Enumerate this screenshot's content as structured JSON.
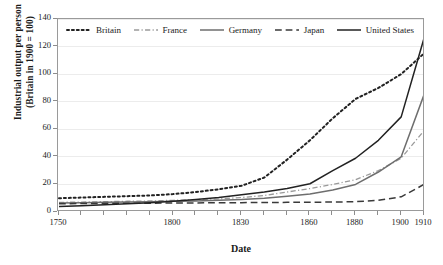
{
  "chart_data": {
    "type": "line",
    "title": "",
    "xlabel": "Date",
    "ylabel": "Industrial output per person (Britain in 1900 = 100)",
    "ylabel_line1": "Industrial output per person",
    "ylabel_line2": "(Britain in 1900 = 100)",
    "ylim": [
      0,
      140
    ],
    "yticks": [
      0,
      20,
      40,
      60,
      80,
      100,
      120,
      140
    ],
    "grid": true,
    "legend_position": "top-inside",
    "x": [
      1750,
      1760,
      1770,
      1780,
      1790,
      1800,
      1810,
      1820,
      1830,
      1840,
      1850,
      1860,
      1870,
      1880,
      1890,
      1900,
      1910
    ],
    "xticks_labeled": [
      1750,
      1800,
      1830,
      1860,
      1880,
      1900,
      1910
    ],
    "xtick_labels": [
      "1750",
      "1800",
      "1830",
      "1860",
      "1880",
      "1900",
      "1910"
    ],
    "series": [
      {
        "name": "Britain",
        "style": "dotted",
        "color": "#222222",
        "values": [
          10,
          10.5,
          11,
          11.5,
          12,
          13,
          14.5,
          16.5,
          19,
          25,
          38,
          52,
          68,
          82,
          90,
          100,
          115
        ]
      },
      {
        "name": "France",
        "style": "dash-dot",
        "color": "#9a9a9a",
        "values": [
          7,
          7.2,
          7.5,
          7.8,
          8,
          8.5,
          9,
          9.5,
          10.5,
          12,
          14.5,
          17,
          20,
          23.5,
          30,
          39,
          59
        ]
      },
      {
        "name": "Germany",
        "style": "solid",
        "color": "#6e6e6e",
        "values": [
          6.5,
          6.7,
          7,
          7.2,
          7.5,
          7.8,
          8,
          8.5,
          9,
          10,
          11.5,
          13,
          16,
          20,
          29,
          40,
          85
        ]
      },
      {
        "name": "Japan",
        "style": "dashed",
        "color": "#3a3a3a",
        "values": [
          6,
          6.1,
          6.2,
          6.3,
          6.4,
          6.5,
          6.6,
          6.7,
          6.8,
          6.9,
          7,
          7.1,
          7.2,
          7.5,
          8.5,
          11,
          20
        ]
      },
      {
        "name": "United States",
        "style": "solid",
        "color": "#222222",
        "values": [
          4,
          4.6,
          5.2,
          6,
          6.8,
          7.8,
          9,
          10.5,
          12.5,
          14.5,
          17,
          20.5,
          30,
          39,
          52,
          69,
          126
        ]
      }
    ]
  },
  "legend": {
    "items": [
      {
        "label": "Britain"
      },
      {
        "label": "France"
      },
      {
        "label": "Germany"
      },
      {
        "label": "Japan"
      },
      {
        "label": "United States"
      }
    ]
  }
}
